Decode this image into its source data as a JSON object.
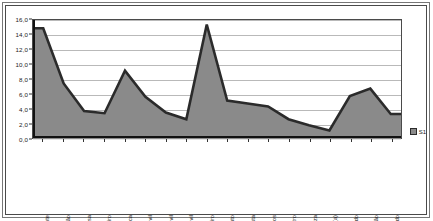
{
  "chart_data": {
    "type": "area",
    "title": "",
    "subtitle": "",
    "xlabel": "",
    "ylabel": "",
    "ylim": [
      0.0,
      16.0
    ],
    "ytick_labels": [
      "0,0",
      "2,0",
      "4,0",
      "6,0",
      "8,0",
      "10,0",
      "12,0",
      "14,0",
      "16,0"
    ],
    "ytick_values": [
      0.0,
      2.0,
      4.0,
      6.0,
      8.0,
      10.0,
      12.0,
      14.0,
      16.0
    ],
    "grid": true,
    "legend_position": "right",
    "legend": [
      "S1"
    ],
    "categories": [
      "Vendedor(a) Ambulante",
      "Empregado de Balcão",
      "Empregado de Mesa",
      "Padeiro / Cozinheiro",
      "T. Agrícola / Pesca",
      "Servente Const. Civil",
      "Pintor Const. Civil",
      "Elect. Const. Civil",
      "Pedreiro",
      "Aj. Mec. / Mecânico Auto",
      "Motorista",
      "Prof. Liberal / Serviços",
      "Músico / Teatro",
      "Doméstico(a) / Limpeza",
      "Aposentado(a)",
      "Desempregado",
      "Sem Profissão",
      "Indeterminado"
    ],
    "series": [
      {
        "name": "S1",
        "values": [
          14.9,
          7.5,
          3.8,
          3.5,
          9.2,
          5.7,
          3.6,
          2.7,
          15.4,
          5.2,
          4.8,
          4.4,
          2.7,
          1.9,
          1.2,
          5.8,
          6.8,
          3.4
        ]
      }
    ]
  },
  "legend": {
    "entries": [
      {
        "label": "S1",
        "color": "#8a8a8a"
      }
    ]
  },
  "colors": {
    "area_fill": "#8a8a8a",
    "line": "#2b2b2b",
    "grid": "#b9b9b9",
    "axis": "#111111",
    "frame": "#4a4a4a",
    "background": "#ffffff"
  }
}
